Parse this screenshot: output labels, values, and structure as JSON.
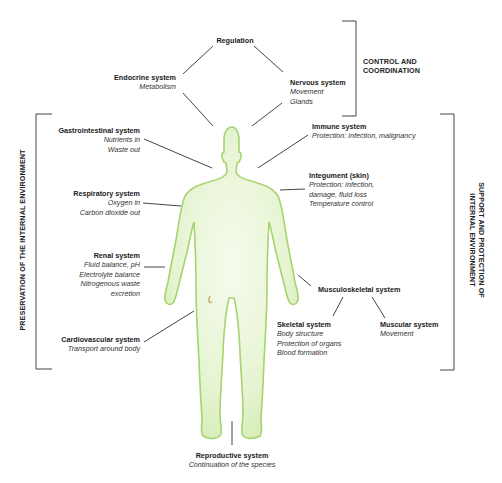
{
  "regulation": {
    "title": "Regulation"
  },
  "endocrine": {
    "title": "Endocrine system",
    "lines": [
      "Metabolism"
    ]
  },
  "nervous": {
    "title": "Nervous system",
    "lines": [
      "Movement",
      "Glands"
    ]
  },
  "control_group": {
    "label_line1": "CONTROL AND",
    "label_line2": "COORDINATION"
  },
  "gastrointestinal": {
    "title": "Gastrointestinal system",
    "lines": [
      "Nutrients in",
      "Waste out"
    ]
  },
  "respiratory": {
    "title": "Respiratory system",
    "lines": [
      "Oxygen in",
      "Carbon dioxide out"
    ]
  },
  "renal": {
    "title": "Renal system",
    "lines": [
      "Fluid balance, pH",
      "Electrolyte balance",
      "Nitrogenous waste",
      "excretion"
    ]
  },
  "cardiovascular": {
    "title": "Cardiovascular system",
    "lines": [
      "Transport around body"
    ]
  },
  "preservation_group": {
    "label": "PRESERVATION OF THE INTERNAL ENVIRONMENT"
  },
  "immune": {
    "title": "Immune system",
    "lines": [
      "Protection: infection, malignancy"
    ]
  },
  "integument": {
    "title": "Integument (skin)",
    "lines": [
      "Protection: infection,",
      "damage, fluid loss",
      "Temperature control"
    ]
  },
  "musculoskeletal": {
    "title": "Musculoskeletal system"
  },
  "skeletal": {
    "title": "Skeletal system",
    "lines": [
      "Body structure",
      "Protection of organs",
      "Blood formation"
    ]
  },
  "muscular": {
    "title": "Muscular system",
    "lines": [
      "Movement"
    ]
  },
  "support_group": {
    "label_line1": "SUPPORT AND PROTECTION OF",
    "label_line2": "INTERNAL ENVIRONMENT"
  },
  "reproductive": {
    "title": "Reproductive system",
    "lines": [
      "Continuation of the species"
    ]
  },
  "colors": {
    "body_fill": "#e3f3cc",
    "body_stroke": "#9fd06a",
    "line": "#444444"
  }
}
